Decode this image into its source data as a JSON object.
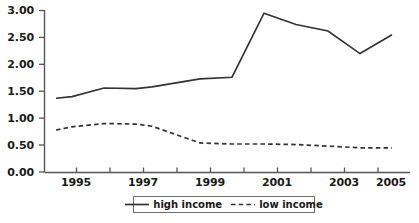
{
  "chart_data": {
    "type": "line",
    "title": "",
    "subtitle": "",
    "xlabel": "",
    "ylabel": "",
    "xlim": [
      1994.5,
      2005
    ],
    "ylim": [
      0.0,
      3.0
    ],
    "grid": false,
    "legend_position": "bottom-center",
    "y_ticks": [
      0.0,
      0.5,
      1.0,
      1.5,
      2.0,
      2.5,
      3.0
    ],
    "y_tick_labels": [
      "0.00",
      "0.50",
      "1.00",
      "1.50",
      "2.00",
      "2.50",
      "3.00"
    ],
    "x_ticks": [
      1995,
      1996,
      1997,
      1998,
      1999,
      2000,
      2001,
      2002,
      2003,
      2004,
      2005
    ],
    "x_tick_labels": [
      "1995",
      "",
      "1997",
      "",
      "1999",
      "",
      "2001",
      "",
      "2003",
      "",
      "2005"
    ],
    "x_labeled_ticks": [
      {
        "value": 1995,
        "label": "1995"
      },
      {
        "value": 1997,
        "label": "1997"
      },
      {
        "value": 1999,
        "label": "1999"
      },
      {
        "value": 2001,
        "label": "2001"
      },
      {
        "value": 2003,
        "label": "2003"
      },
      {
        "value": 2005,
        "label": "2005"
      }
    ],
    "x": [
      1994.5,
      1995,
      1996,
      1997,
      1997.5,
      1999,
      2000,
      2001,
      2002,
      2003,
      2004,
      2005
    ],
    "series": [
      {
        "name": "high income",
        "style": "solid",
        "color": "#333333",
        "x": [
          1994.5,
          1995,
          1996,
          1997,
          1997.5,
          1999,
          2000,
          2001,
          2002,
          2003,
          2004,
          2005
        ],
        "values": [
          1.37,
          1.4,
          1.56,
          1.55,
          1.58,
          1.73,
          1.76,
          2.95,
          2.74,
          2.62,
          2.2,
          2.55
        ]
      },
      {
        "name": "low income",
        "style": "dashed",
        "color": "#333333",
        "x": [
          1994.5,
          1995,
          1996,
          1997,
          1997.5,
          1999,
          2000,
          2001,
          2002,
          2003,
          2004,
          2005
        ],
        "values": [
          0.78,
          0.84,
          0.9,
          0.89,
          0.85,
          0.54,
          0.52,
          0.52,
          0.51,
          0.48,
          0.45,
          0.45
        ]
      }
    ]
  },
  "axes": {
    "y_labels": [
      "3.00",
      "2.50",
      "2.00",
      "1.50",
      "1.00",
      "0.50",
      "0.00"
    ],
    "x_labels": [
      "1995",
      "1997",
      "1999",
      "2001",
      "2003",
      "2005"
    ]
  },
  "legend": {
    "entries": [
      {
        "label": "high income",
        "style": "solid"
      },
      {
        "label": "low income",
        "style": "dashed"
      }
    ]
  },
  "colors": {
    "background": "#ffffff",
    "line": "#333333",
    "axis": "#555555",
    "text": "#1a1a1a",
    "legend_border": "#6b6b6b"
  }
}
